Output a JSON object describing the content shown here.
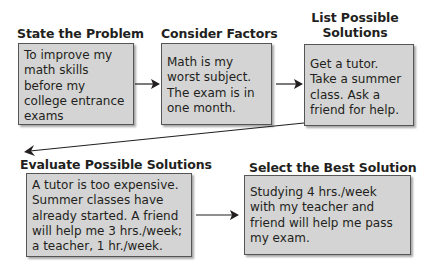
{
  "steps": [
    {
      "heading": "State the Problem",
      "lines": [
        "To improve my",
        "math skills",
        "before my",
        "college entrance",
        "exams"
      ]
    },
    {
      "heading": "Consider Factors",
      "lines": [
        "Math is my",
        "worst subject.",
        "The exam is in",
        "one month."
      ]
    },
    {
      "heading_lines": [
        "List Possible",
        "Solutions"
      ],
      "lines": [
        "Get a tutor.",
        "Take a summer",
        "class. Ask a",
        "friend for help."
      ]
    },
    {
      "heading": "Evaluate Possible Solutions",
      "lines": [
        "A tutor is too expensive.",
        "Summer classes have",
        "already started. A friend",
        "will help me 3 hrs./week;",
        "a teacher, 1 hr./week."
      ]
    },
    {
      "heading": "Select the Best Solution",
      "lines": [
        "Studying 4 hrs./week",
        "with my teacher and",
        "friend will help me pass",
        "my exam."
      ]
    }
  ],
  "colors": {
    "box_fill": "#d4d4d4",
    "box_border": "#555555",
    "arrow": "#231f20"
  }
}
